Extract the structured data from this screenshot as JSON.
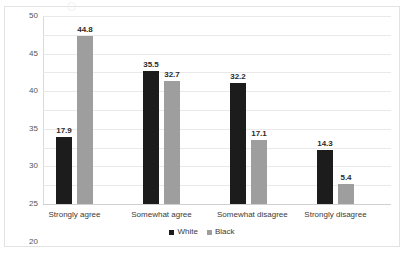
{
  "chart_data": {
    "type": "bar",
    "title": "",
    "subtitle": "",
    "xlabel": "",
    "ylabel": "",
    "ylim": [
      0,
      50
    ],
    "ytick_step": 5,
    "yticks": [
      "50",
      "45",
      "40",
      "35",
      "30",
      "25",
      "20",
      "15",
      "10",
      "5",
      "0"
    ],
    "grid": true,
    "legend_position": "bottom",
    "categories": [
      "Strongly agree",
      "Somewhat agree",
      "Somewhat disagree",
      "Strongly disagree"
    ],
    "series": [
      {
        "name": "White",
        "color": "#1c1c1c",
        "values": [
          17.9,
          35.5,
          32.2,
          14.3
        ],
        "labels": [
          "17.9",
          "35.5",
          "32.2",
          "14.3"
        ]
      },
      {
        "name": "Black",
        "color": "#9e9e9e",
        "values": [
          44.8,
          32.7,
          17.1,
          5.4
        ],
        "labels": [
          "44.8",
          "32.7",
          "17.1",
          "5.4"
        ]
      }
    ]
  }
}
